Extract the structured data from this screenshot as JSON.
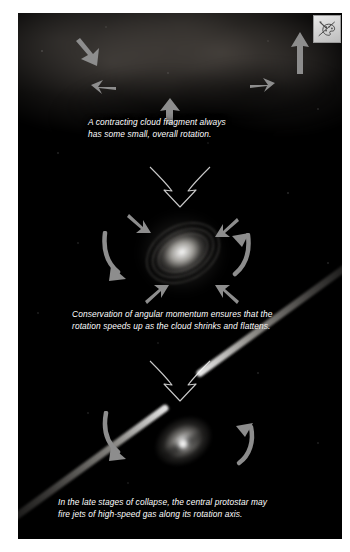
{
  "figure": {
    "background_color": "#000000",
    "page_color": "#ffffff",
    "text_color": "#ffffff"
  },
  "panels": [
    {
      "id": "panel-cloud",
      "name": "contracting-cloud-fragment",
      "caption": "A contracting cloud fragment always\nhas some small, overall rotation.",
      "object": "dark molecular cloud fragment",
      "arrow_count": 5,
      "arrow_direction": "inward"
    },
    {
      "id": "panel-disk",
      "name": "flattened-rotating-disk",
      "caption": "Conservation of angular momentum ensures that the\nrotation speeds up as the cloud shrinks and flattens.",
      "object": "flattened rotating protostellar disk",
      "arrow_count": 6,
      "arrow_direction": "inward and rotational"
    },
    {
      "id": "panel-protostar",
      "name": "protostar-with-jets",
      "caption": "In the late stages of collapse, the central protostar may\nfire jets of high-speed gas along its rotation axis.",
      "object": "central protostar with bipolar jets",
      "arrow_count": 2,
      "arrow_direction": "rotational"
    }
  ],
  "transitions": [
    {
      "name": "transition-arrow-1",
      "label": "collapse continues"
    },
    {
      "name": "transition-arrow-2",
      "label": "collapse continues"
    }
  ],
  "badge": {
    "name": "image-placeholder-badge",
    "icon": "palette-brush-icon",
    "label": ""
  },
  "colors": {
    "plate": "#000000",
    "caption_text": "#ffffff",
    "motion_arrow": "#8f8f8f",
    "transition_arrow_stroke": "#c8c8c8",
    "jet": "#ffffff",
    "badge_face": "#d6d6d6"
  }
}
